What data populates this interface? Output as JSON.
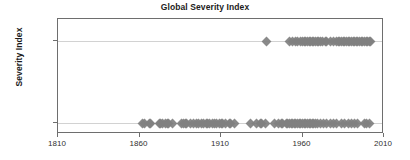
{
  "chart_data": {
    "type": "scatter",
    "title": "Global Severity Index",
    "xlabel": "",
    "ylabel": "Severity Index",
    "xlim": [
      1810,
      2010
    ],
    "ylim_categories": [
      "<10",
      ">10"
    ],
    "xticks": [
      1810,
      1860,
      1910,
      1960,
      2010
    ],
    "xtick_labels": [
      "1810",
      "1860",
      "1910",
      "1960",
      "2010"
    ],
    "yticks": [
      "<10",
      ">10"
    ],
    "ytick_labels": [
      "<10",
      ">10"
    ],
    "grid": "horizontal",
    "legend": "none",
    "marker": "diamond",
    "marker_color": "#808080",
    "axis_color": "#6e6e6e",
    "gridline_color": "#d2d2d2",
    "title_color": "#1b1b1b",
    "series": [
      {
        "name": ">10",
        "y_category": ">10",
        "x": [
          1938,
          1952,
          1954,
          1956,
          1957,
          1959,
          1960,
          1961,
          1962,
          1963,
          1964,
          1965,
          1966,
          1967,
          1968,
          1969,
          1970,
          1971,
          1972,
          1974,
          1975,
          1977,
          1979,
          1981,
          1982,
          1983,
          1984,
          1985,
          1986,
          1987,
          1988,
          1989,
          1990,
          1991,
          1992,
          1993,
          1994,
          1995,
          1996,
          1997,
          1998,
          1999,
          2000,
          2001,
          2002
        ]
      },
      {
        "name": "<10",
        "y_category": "<10",
        "x": [
          1862,
          1863,
          1866,
          1867,
          1872,
          1873,
          1874,
          1876,
          1877,
          1878,
          1880,
          1886,
          1887,
          1888,
          1889,
          1891,
          1893,
          1895,
          1896,
          1898,
          1899,
          1901,
          1902,
          1903,
          1905,
          1906,
          1907,
          1909,
          1910,
          1911,
          1913,
          1915,
          1916,
          1918,
          1928,
          1932,
          1934,
          1935,
          1937,
          1943,
          1945,
          1947,
          1948,
          1950,
          1951,
          1952,
          1953,
          1954,
          1955,
          1956,
          1957,
          1958,
          1959,
          1960,
          1961,
          1962,
          1963,
          1964,
          1965,
          1966,
          1967,
          1968,
          1969,
          1971,
          1973,
          1975,
          1977,
          1979,
          1981,
          1984,
          1986,
          1988,
          1990,
          1992,
          1994,
          1998,
          1999,
          2001
        ]
      }
    ]
  }
}
